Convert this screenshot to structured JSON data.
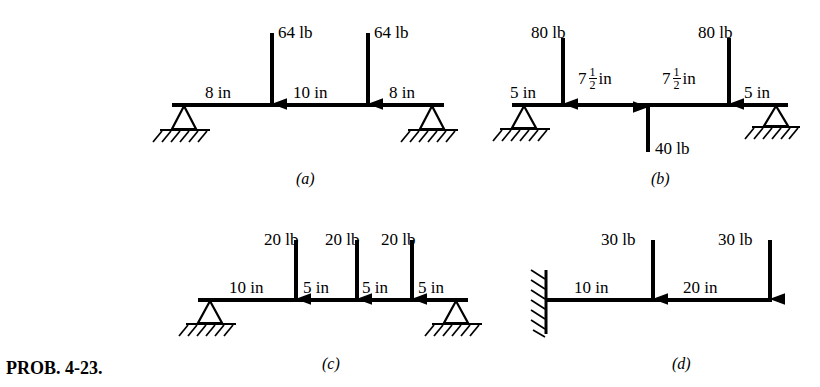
{
  "problem": {
    "label": "PROB. 4-23."
  },
  "figures": [
    {
      "key": "a",
      "caption": "(a)",
      "support_left": "pin-support",
      "support_right": "pin-support",
      "loads": [
        {
          "name": "load-64-lb-left",
          "label": "64 lb",
          "direction": "down"
        },
        {
          "name": "load-64-lb-right",
          "label": "64 lb",
          "direction": "down"
        }
      ],
      "dimensions": [
        {
          "name": "dim-8-in-left",
          "label": "8 in"
        },
        {
          "name": "dim-10-in-middle",
          "label": "10 in"
        },
        {
          "name": "dim-8-in-right",
          "label": "8 in"
        }
      ]
    },
    {
      "key": "b",
      "caption": "(b)",
      "support_left": "pin-support",
      "support_right": "pin-support",
      "loads": [
        {
          "name": "load-80-lb-left",
          "label": "80 lb",
          "direction": "down"
        },
        {
          "name": "load-80-lb-right",
          "label": "80 lb",
          "direction": "down"
        },
        {
          "name": "load-40-lb-center",
          "label": "40 lb",
          "direction": "up"
        }
      ],
      "dimensions": [
        {
          "name": "dim-5-in-left",
          "label": "5 in"
        },
        {
          "name": "dim-7-half-in-left",
          "whole": "7",
          "numerator": "1",
          "denominator": "2",
          "unit": "in"
        },
        {
          "name": "dim-7-half-in-right",
          "whole": "7",
          "numerator": "1",
          "denominator": "2",
          "unit": "in"
        },
        {
          "name": "dim-5-in-right",
          "label": "5 in"
        }
      ]
    },
    {
      "key": "c",
      "caption": "(c)",
      "support_left": "pin-support",
      "support_right": "pin-support",
      "loads": [
        {
          "name": "load-20-lb-first",
          "label": "20 lb",
          "direction": "down"
        },
        {
          "name": "load-20-lb-second",
          "label": "20 lb",
          "direction": "down"
        },
        {
          "name": "load-20-lb-third",
          "label": "20 lb",
          "direction": "down"
        }
      ],
      "dimensions": [
        {
          "name": "dim-10-in",
          "label": "10 in"
        },
        {
          "name": "dim-5-in-first",
          "label": "5 in"
        },
        {
          "name": "dim-5-in-second",
          "label": "5 in"
        },
        {
          "name": "dim-5-in-third",
          "label": "5 in"
        }
      ]
    },
    {
      "key": "d",
      "caption": "(d)",
      "support_left": "fixed-wall-support",
      "support_right": "free-end",
      "loads": [
        {
          "name": "load-30-lb-middle",
          "label": "30 lb",
          "direction": "down"
        },
        {
          "name": "load-30-lb-end",
          "label": "30 lb",
          "direction": "down"
        }
      ],
      "dimensions": [
        {
          "name": "dim-10-in",
          "label": "10 in"
        },
        {
          "name": "dim-20-in",
          "label": "20 in"
        }
      ]
    }
  ],
  "colors": {
    "ink": "#000000",
    "background": "#ffffff"
  }
}
